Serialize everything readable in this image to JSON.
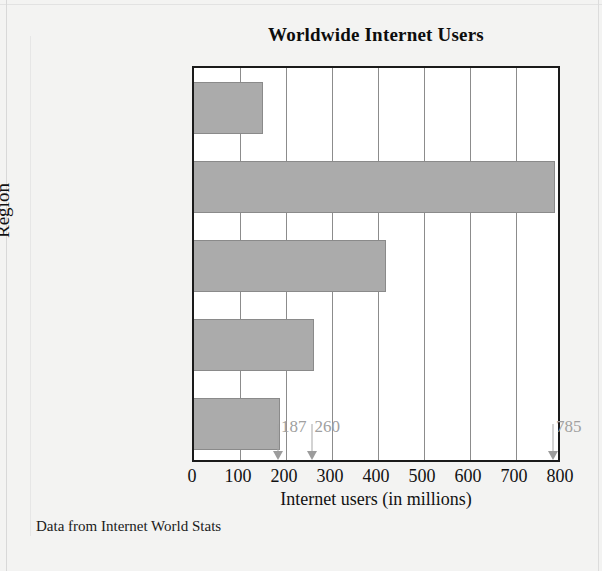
{
  "chart_data": {
    "type": "bar",
    "orientation": "horizontal",
    "title": "Worldwide Internet Users",
    "xlabel": "Internet users (in millions)",
    "ylabel": "Region",
    "xlim": [
      0,
      800
    ],
    "xticks": [
      0,
      100,
      200,
      300,
      400,
      500,
      600,
      700,
      800
    ],
    "grid": true,
    "legend": null,
    "source_note": "Data from Internet World Stats",
    "categories": [
      "Africa/\nMiddle East",
      "Asia/\nOceania\nAustralia",
      "Europe",
      "North\nAmerica",
      "Latin\nAmerica/\nCaribbean"
    ],
    "values": [
      150,
      785,
      418,
      260,
      187
    ],
    "annotations": [
      {
        "label": "187",
        "value": 187
      },
      {
        "label": "260",
        "value": 260
      },
      {
        "label": "785",
        "value": 785
      }
    ],
    "colors": {
      "bar_fill": "#ababab",
      "bar_edge": "#8a8a8a",
      "plot_background": "#ffffff",
      "page_background": "#f3f3f2",
      "frame": "#1a1a1a",
      "gridline": "#8c8c8c",
      "annotation": "#a0a0a0",
      "text": "#111111"
    }
  }
}
